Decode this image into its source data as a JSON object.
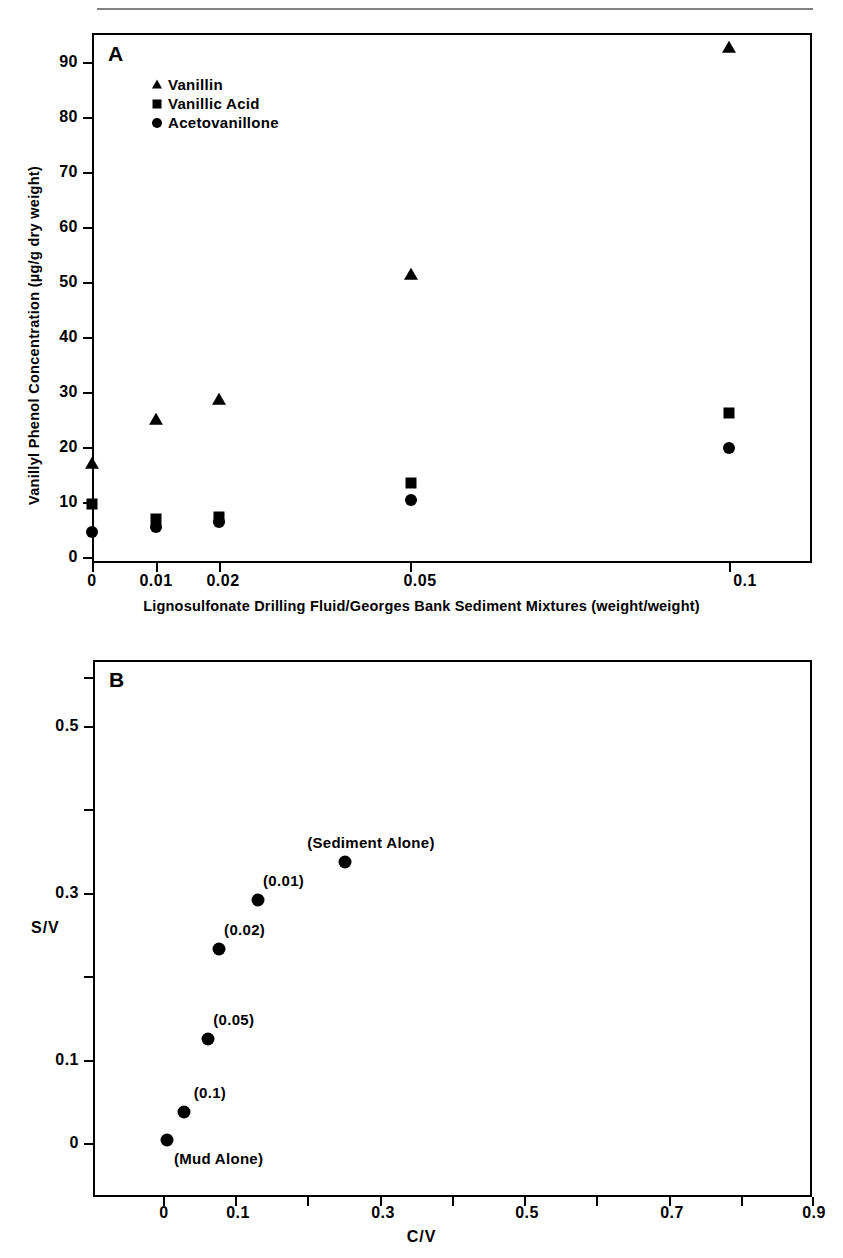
{
  "figure": {
    "panels": [
      "A",
      "B"
    ]
  },
  "panelA": {
    "letter": "A",
    "ylabel": "Vanillyl Phenol Concentration (µg/g dry weight)",
    "xlabel": "Lignosulfonate Drilling Fluid/Georges Bank Sediment Mixtures (weight/weight)",
    "yticks": [
      "0",
      "10",
      "20",
      "30",
      "40",
      "50",
      "60",
      "70",
      "80",
      "90"
    ],
    "xticks": [
      "0",
      "0.01",
      "0.02",
      "0.05",
      "0.1"
    ],
    "legend": [
      {
        "symbol": "triangle",
        "label": "Vanillin"
      },
      {
        "symbol": "square",
        "label": "Vanillic Acid"
      },
      {
        "symbol": "circle",
        "label": "Acetovanillone"
      }
    ]
  },
  "panelB": {
    "letter": "B",
    "ylabel": "S/V",
    "xlabel": "C/V",
    "yticks": [
      "0",
      "0.1",
      "0.3",
      "0.5"
    ],
    "xticks": [
      "0",
      "0.1",
      "0.3",
      "0.5",
      "0.7",
      "0.9"
    ],
    "point_labels": [
      "(Sediment Alone)",
      "(0.01)",
      "(0.02)",
      "(0.05)",
      "(0.1)",
      "(Mud Alone)"
    ]
  },
  "chart_data": [
    {
      "type": "scatter",
      "panel": "A",
      "title": "",
      "xlabel": "Lignosulfonate Drilling Fluid/Georges Bank Sediment Mixtures (weight/weight)",
      "ylabel": "Vanillyl Phenol Concentration (µg/g dry weight)",
      "x_categories": [
        "0",
        "0.01",
        "0.02",
        "0.05",
        "0.1"
      ],
      "x_positions": [
        0,
        0.01,
        0.02,
        0.05,
        0.1
      ],
      "xlim": [
        0,
        0.113
      ],
      "ylim": [
        0,
        95
      ],
      "ytick_values": [
        0,
        10,
        20,
        30,
        40,
        50,
        60,
        70,
        80,
        90
      ],
      "grid": false,
      "legend_position": "upper-left-inside",
      "series": [
        {
          "name": "Vanillin",
          "marker": "triangle",
          "color": "#000000",
          "values": [
            17.0,
            25.0,
            28.5,
            51.2,
            92.5
          ]
        },
        {
          "name": "Vanillic Acid",
          "marker": "square",
          "color": "#000000",
          "values": [
            9.7,
            7.0,
            7.3,
            13.5,
            26.2
          ]
        },
        {
          "name": "Acetovanillone",
          "marker": "circle",
          "color": "#000000",
          "values": [
            4.5,
            5.5,
            6.4,
            10.4,
            19.8
          ]
        }
      ]
    },
    {
      "type": "scatter",
      "panel": "B",
      "title": "",
      "xlabel": "C/V",
      "ylabel": "S/V",
      "xlim": [
        -0.05,
        0.9
      ],
      "ylim": [
        -0.06,
        0.62
      ],
      "xtick_values": [
        0,
        0.1,
        0.2,
        0.3,
        0.4,
        0.5,
        0.6,
        0.7,
        0.8,
        0.9
      ],
      "xtick_labeled": [
        0,
        0.1,
        0.3,
        0.5,
        0.7,
        0.9
      ],
      "ytick_values": [
        0,
        0.1,
        0.2,
        0.3,
        0.4,
        0.5,
        0.6
      ],
      "ytick_labeled": [
        0,
        0.1,
        0.3,
        0.5
      ],
      "grid": false,
      "points": [
        {
          "label": "(Mud Alone)",
          "x": 0.005,
          "y": 0.004,
          "label_position": "below"
        },
        {
          "label": "(0.1)",
          "x": 0.029,
          "y": 0.037,
          "label_position": "above"
        },
        {
          "label": "(0.05)",
          "x": 0.062,
          "y": 0.124,
          "label_position": "above"
        },
        {
          "label": "(0.02)",
          "x": 0.077,
          "y": 0.232,
          "label_position": "above"
        },
        {
          "label": "(0.01)",
          "x": 0.131,
          "y": 0.291,
          "label_position": "above"
        },
        {
          "label": "(Sediment Alone)",
          "x": 0.252,
          "y": 0.337,
          "label_position": "above"
        }
      ]
    }
  ]
}
